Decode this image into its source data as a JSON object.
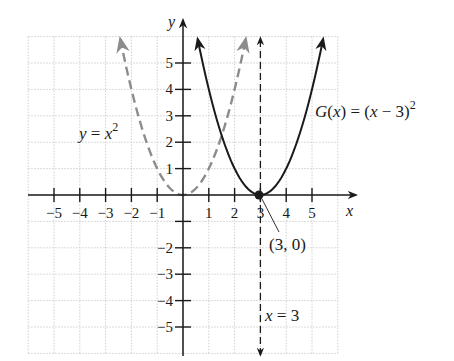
{
  "chart_data": {
    "type": "line",
    "title": "",
    "xlabel": "x",
    "ylabel": "y",
    "xlim": [
      -6,
      6
    ],
    "ylim": [
      -6,
      6
    ],
    "grid": true,
    "x_ticks": [
      -5,
      -4,
      -3,
      -2,
      -1,
      1,
      2,
      3,
      4,
      5
    ],
    "y_ticks": [
      -5,
      -4,
      -3,
      -2,
      -1,
      1,
      2,
      3,
      4,
      5
    ],
    "x_tick_labels": [
      "−5",
      "−4",
      "−3",
      "−2",
      "−1",
      "1",
      "2",
      "3",
      "4",
      "5"
    ],
    "y_tick_labels": [
      "5",
      "4",
      "3",
      "2",
      "1",
      "−2",
      "−3",
      "−4",
      "−5"
    ],
    "series": [
      {
        "name": "y = x^2",
        "label": "y = x",
        "label_sup": "2",
        "style": "dashed",
        "color": "#8c8c8c",
        "function": "x^2",
        "x": [
          -2.45,
          -2,
          -1,
          0,
          1,
          2,
          2.45
        ],
        "y": [
          6,
          4,
          1,
          0,
          1,
          4,
          6
        ]
      },
      {
        "name": "G(x) = (x - 3)^2",
        "label": "G(x) = (x − 3)",
        "label_sup": "2",
        "style": "solid",
        "color": "#1a1a1a",
        "function": "(x-3)^2",
        "x": [
          0.55,
          1,
          2,
          3,
          4,
          5,
          5.45
        ],
        "y": [
          6,
          4,
          1,
          0,
          1,
          4,
          6
        ]
      },
      {
        "name": "x = 3",
        "label": "x = 3",
        "style": "dashed",
        "color": "#1a1a1a",
        "type": "vertical_line",
        "x_value": 3
      }
    ],
    "annotations": [
      {
        "text": "(3, 0)",
        "point": [
          3,
          0
        ],
        "type": "vertex"
      }
    ]
  },
  "axes": {
    "x_label": "x",
    "y_label": "y"
  },
  "labels": {
    "parabola_base": "y = x",
    "parabola_base_sup": "2",
    "parabola_shifted": "G(x) = (x − 3)",
    "parabola_shifted_sup": "2",
    "axis_of_symmetry": "x = 3",
    "vertex": "(3, 0)"
  },
  "ticks": {
    "x": [
      "−5",
      "−4",
      "−3",
      "−2",
      "−1",
      "1",
      "2",
      "3",
      "4",
      "5"
    ],
    "y_pos": [
      "1",
      "2",
      "3",
      "4",
      "5"
    ],
    "y_neg": [
      "−2",
      "−3",
      "−4",
      "−5"
    ]
  },
  "colors": {
    "axis": "#1a1a1a",
    "grid": "#cfcfcf",
    "base_curve": "#8c8c8c",
    "shifted_curve": "#1a1a1a"
  }
}
